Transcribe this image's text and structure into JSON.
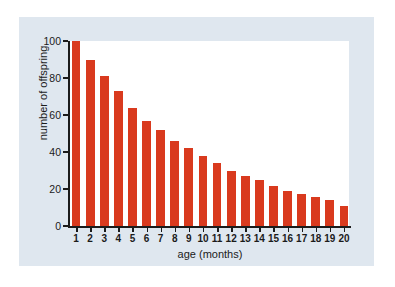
{
  "chart_data": {
    "type": "bar",
    "title": "",
    "xlabel": "age (months)",
    "ylabel": "number of offspring",
    "categories": [
      "1",
      "2",
      "3",
      "4",
      "5",
      "6",
      "7",
      "8",
      "9",
      "10",
      "11",
      "12",
      "13",
      "14",
      "15",
      "16",
      "17",
      "18",
      "19",
      "20"
    ],
    "values": [
      100,
      90,
      81,
      73,
      64,
      57,
      52,
      46,
      42,
      38,
      34,
      30,
      27,
      25,
      21.5,
      19,
      17.5,
      15.5,
      14,
      11
    ],
    "ylim": [
      0,
      100
    ],
    "yticks": [
      0,
      20,
      40,
      60,
      80,
      100
    ],
    "ytick_labels": [
      "0",
      "20",
      "40",
      "60",
      "80",
      "100"
    ],
    "grid": false,
    "legend": null,
    "bar_color": "#d93a1e",
    "plot_background": "#ffffff",
    "figure_background": "#dfe7ef"
  }
}
